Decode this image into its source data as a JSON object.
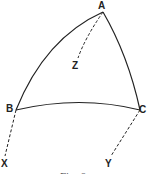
{
  "figure": {
    "caption": "Fig. 6",
    "points": {
      "A": {
        "label": "A"
      },
      "B": {
        "label": "B"
      },
      "C": {
        "label": "C"
      },
      "X": {
        "label": "X"
      },
      "Y": {
        "label": "Y"
      },
      "Z": {
        "label": "Z"
      }
    },
    "edges": [
      {
        "from": "A",
        "to": "B",
        "style": "solid-arc"
      },
      {
        "from": "A",
        "to": "C",
        "style": "solid-arc"
      },
      {
        "from": "B",
        "to": "C",
        "style": "solid-arc"
      },
      {
        "from": "A",
        "to": "Z",
        "style": "dashed"
      },
      {
        "from": "B",
        "to": "X",
        "style": "dashed"
      },
      {
        "from": "C",
        "to": "Y",
        "style": "dashed"
      }
    ],
    "colors": {
      "stroke": "#222222",
      "background": "#ffffff"
    }
  }
}
